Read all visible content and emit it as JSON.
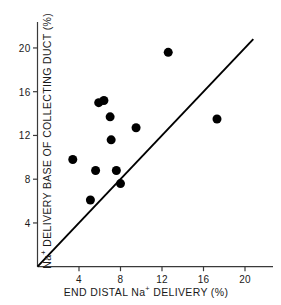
{
  "chart_data": {
    "type": "scatter",
    "title": "",
    "xlabel": "END DISTAL Na+ DELIVERY (%)",
    "ylabel": "Na+ DELIVERY BASE OF COLLECTING DUCT (%)",
    "xlabel_parts": {
      "pre": "END DISTAL Na",
      "sup": "+",
      "post": " DELIVERY (%)"
    },
    "ylabel_parts": {
      "pre": "Na",
      "sup": "+",
      "post": " DELIVERY BASE OF COLLECTING DUCT (%)"
    },
    "xlim": [
      0,
      21.2
    ],
    "ylim": [
      0,
      21.3
    ],
    "xticks": [
      4,
      8,
      12,
      16,
      20
    ],
    "xtick_labels": [
      "4",
      "8",
      "12",
      "16",
      "20"
    ],
    "yticks": [
      4,
      8,
      12,
      16,
      20
    ],
    "ytick_labels": [
      "4",
      "8",
      "12",
      "16",
      "20"
    ],
    "grid": false,
    "legend": null,
    "marker": "filled-circle",
    "marker_color": "#000000",
    "marker_size_px": 9,
    "axis_color": "#3a3a3a",
    "line_color": "#000000",
    "points": [
      {
        "x": 3.4,
        "y": 9.8
      },
      {
        "x": 5.1,
        "y": 6.1
      },
      {
        "x": 5.6,
        "y": 8.8
      },
      {
        "x": 5.9,
        "y": 15.0
      },
      {
        "x": 6.4,
        "y": 15.2
      },
      {
        "x": 7.0,
        "y": 13.7
      },
      {
        "x": 7.1,
        "y": 11.6
      },
      {
        "x": 7.6,
        "y": 8.8
      },
      {
        "x": 8.0,
        "y": 7.6
      },
      {
        "x": 9.5,
        "y": 12.7
      },
      {
        "x": 12.6,
        "y": 19.6
      },
      {
        "x": 17.3,
        "y": 13.5
      }
    ],
    "reference_line": {
      "name": "identity-line",
      "x1": 0,
      "y1": 0,
      "x2": 20.8,
      "y2": 20.8
    }
  }
}
